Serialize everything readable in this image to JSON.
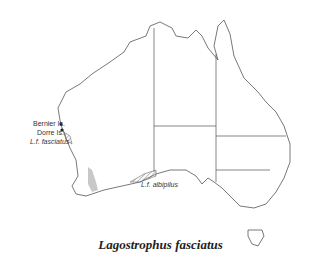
{
  "title": "Lagostrophus fasciatus",
  "labels": {
    "bernier": "Bernier Is.",
    "dorre": "Dorre Is.",
    "fasciatus": "L.f. fasciatus",
    "albipilus": "L.f. albipilus"
  },
  "colors": {
    "outline": "#555555",
    "range_fill": "#c8c8c8",
    "hatch": "#555555"
  }
}
